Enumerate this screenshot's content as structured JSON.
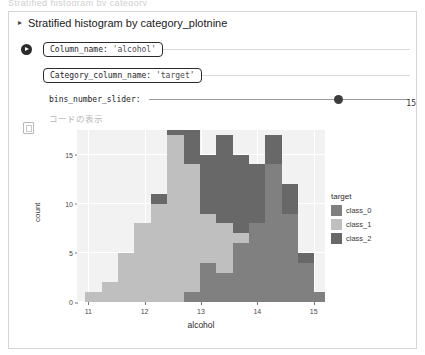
{
  "clipped_top_text": "Stratified histogram by category",
  "panel": {
    "disclosure_glyph": "▸",
    "title": "Stratified histogram by category_plotnine"
  },
  "widgets": {
    "run_icon": "play-icon",
    "column_name": {
      "label": "Column_name:",
      "value": "'alcohol'"
    },
    "category_column_name": {
      "label": "Category_column_name:",
      "value": "'target'"
    },
    "bins_slider": {
      "label": "bins_number_slider:",
      "value": "15",
      "handle_pct": 71
    },
    "code_toggle_label": "コードの表示"
  },
  "output": {
    "prompt_icon": "output-cell-icon"
  },
  "chart_data": {
    "type": "bar",
    "subtype": "stacked-histogram",
    "title": "",
    "xlabel": "alcohol",
    "ylabel": "count",
    "xlim": [
      10.8,
      15.2
    ],
    "ylim": [
      0,
      17.5
    ],
    "xticks": [
      11,
      12,
      13,
      14,
      15
    ],
    "yticks": [
      0,
      5,
      10,
      15
    ],
    "grid": true,
    "legend": {
      "title": "target",
      "position": "right",
      "entries": [
        {
          "name": "class_0",
          "color": "#808080"
        },
        {
          "name": "class_1",
          "color": "#bfbfbf"
        },
        {
          "name": "class_2",
          "color": "#686868"
        }
      ]
    },
    "bin_edges": [
      10.95,
      11.24,
      11.53,
      11.82,
      12.11,
      12.4,
      12.69,
      12.98,
      13.27,
      13.56,
      13.85,
      14.14,
      14.43,
      14.72,
      15.01,
      15.3
    ],
    "bin_centers": [
      11.1,
      11.39,
      11.68,
      11.97,
      12.26,
      12.55,
      12.84,
      13.13,
      13.42,
      13.71,
      14.0,
      14.29,
      14.58,
      14.87,
      15.16
    ],
    "series": [
      {
        "name": "class_0",
        "color": "#808080",
        "values": [
          0,
          0,
          0,
          0,
          0,
          0,
          1,
          4,
          3,
          6,
          8,
          14,
          9,
          4,
          1
        ]
      },
      {
        "name": "class_1",
        "color": "#bfbfbf",
        "values": [
          1,
          2,
          5,
          8,
          10,
          17,
          13,
          5,
          5,
          1,
          0,
          0,
          0,
          0,
          0
        ]
      },
      {
        "name": "class_2",
        "color": "#686868",
        "values": [
          0,
          0,
          0,
          0,
          1,
          4,
          7,
          6,
          9,
          8,
          6,
          3,
          3,
          1,
          0
        ]
      }
    ],
    "totals": [
      1,
      2,
      5,
      8,
      11,
      21,
      21,
      15,
      17,
      15,
      14,
      17,
      12,
      5,
      1
    ]
  }
}
